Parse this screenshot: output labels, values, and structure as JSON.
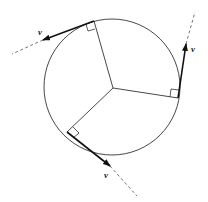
{
  "diagram": {
    "colors": {
      "stroke": "#333333",
      "arrow": "#111111",
      "dashed": "#666666",
      "background": "#ffffff"
    },
    "circle": {
      "cx": 112,
      "cy": 87,
      "r": 68
    },
    "center": {
      "x": 113,
      "y": 88
    },
    "vectors": [
      {
        "id": "top",
        "label": "v"
      },
      {
        "id": "right",
        "label": "v"
      },
      {
        "id": "bottom",
        "label": "v"
      }
    ]
  }
}
